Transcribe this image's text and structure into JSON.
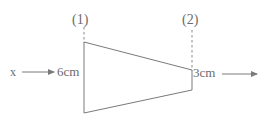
{
  "figure": {
    "type": "engineering-diagram",
    "background_color": "#ffffff",
    "line_color": "#7a7a7a",
    "text_color": "#6b6b6b",
    "labels": {
      "section_1": "(1)",
      "section_2": "(2)",
      "axis_x": "x",
      "inlet_dimension": "6cm",
      "outlet_dimension": "3cm"
    },
    "geometry": {
      "duct_vertices": "84,42 192,70 192,90 84,113",
      "inlet_edge": {
        "x": 84,
        "y_top": 42,
        "y_bottom": 113
      },
      "outlet_edge": {
        "x": 192,
        "y_top": 70,
        "y_bottom": 90
      },
      "section_line_1": {
        "x": 84,
        "y_top": 27,
        "y_bottom": 43
      },
      "section_line_2": {
        "x": 192,
        "y_top": 30,
        "y_bottom": 71
      },
      "inlet_arrow": {
        "x_start": 22,
        "x_end": 55,
        "y": 72
      },
      "outlet_arrow": {
        "x_start": 222,
        "x_end": 258,
        "y": 74
      }
    }
  }
}
